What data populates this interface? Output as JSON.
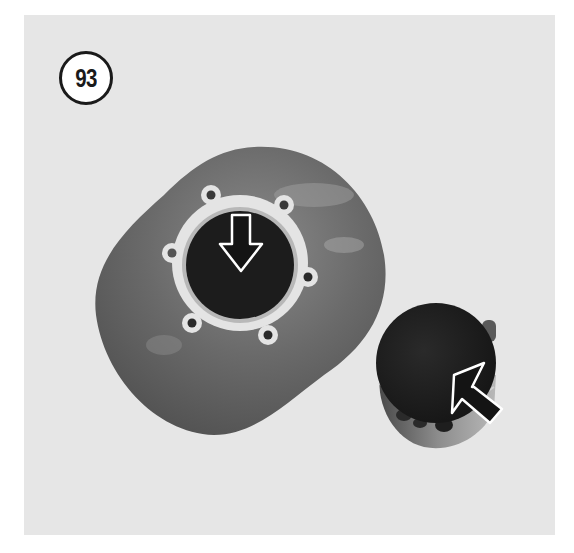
{
  "figure": {
    "number_label": "93",
    "arrows": [
      {
        "name": "cylinder-bore-arrow",
        "direction": "down"
      },
      {
        "name": "piston-crown-arrow",
        "direction": "up-left"
      }
    ]
  },
  "colors": {
    "background": "#e6e6e6",
    "plate": "#6e6e6e",
    "bore": "#1c1c1c",
    "gasket": "#e8e8e8",
    "arrow_fill": "#141414",
    "arrow_outline": "#ffffff"
  }
}
